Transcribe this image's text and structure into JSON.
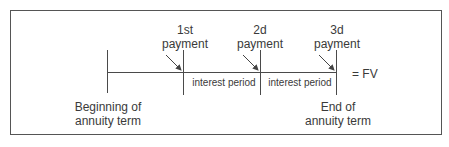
{
  "diagram": {
    "start_label_line1": "Beginning of",
    "start_label_line2": "annuity term",
    "end_label_line1": "End of",
    "end_label_line2": "annuity term",
    "payments": [
      {
        "line1": "1st",
        "line2": "payment"
      },
      {
        "line1": "2d",
        "line2": "payment"
      },
      {
        "line1": "3d",
        "line2": "payment"
      }
    ],
    "intervals": [
      "interest period",
      "interest period"
    ],
    "result_label": "= FV"
  }
}
